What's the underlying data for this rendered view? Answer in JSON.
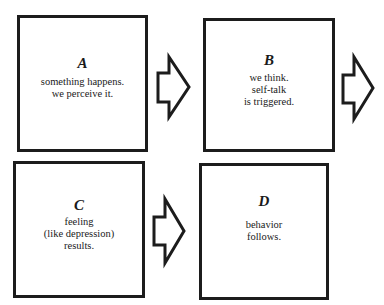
{
  "diagram": {
    "type": "flow",
    "boxes": [
      {
        "id": "A",
        "letter": "A",
        "text": "something happens.\nwe perceive it."
      },
      {
        "id": "B",
        "letter": "B",
        "text": "we think.\nself-talk\nis triggered."
      },
      {
        "id": "C",
        "letter": "C",
        "text": "feeling\n(like depression)\nresults."
      },
      {
        "id": "D",
        "letter": "D",
        "text": "behavior\nfollows."
      }
    ],
    "arrows": [
      {
        "from": "A",
        "to": "B",
        "icon": "block-arrow-right-icon"
      },
      {
        "from": "B",
        "to": "C",
        "icon": "block-arrow-right-icon"
      },
      {
        "from": "C",
        "to": "D",
        "icon": "block-arrow-right-icon"
      }
    ],
    "colors": {
      "stroke": "#1c1c1c",
      "background": "#ffffff"
    }
  }
}
